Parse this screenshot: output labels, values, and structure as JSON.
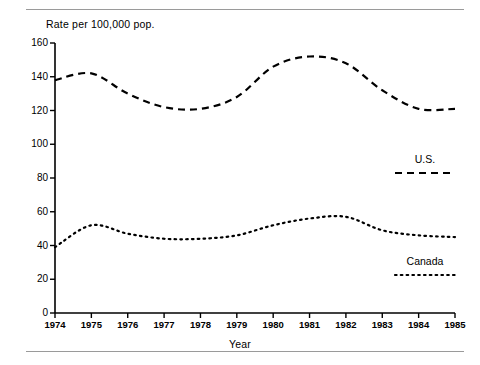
{
  "figure": {
    "top_rule": "horizontal-rule",
    "bottom_rule": "horizontal-rule"
  },
  "chart_data": {
    "type": "line",
    "title": "",
    "subtitle": "",
    "xlabel": "Year",
    "ylabel": "Rate per 100,000 pop.",
    "xlim": [
      1974,
      1985
    ],
    "ylim": [
      0,
      160
    ],
    "ytick_labels": [
      "0",
      "20",
      "40",
      "60",
      "80",
      "100",
      "120",
      "140",
      "160"
    ],
    "ytick_values": [
      0,
      20,
      40,
      60,
      80,
      100,
      120,
      140,
      160
    ],
    "xtick_labels": [
      "1974",
      "1975",
      "1976",
      "1977",
      "1978",
      "1979",
      "1980",
      "1981",
      "1982",
      "1983",
      "1984",
      "1985"
    ],
    "x": [
      1974,
      1975,
      1976,
      1977,
      1978,
      1979,
      1980,
      1981,
      1982,
      1983,
      1984,
      1985
    ],
    "grid": false,
    "legend_position": "right-inside",
    "series": [
      {
        "name": "U.S.",
        "linestyle": "dashed",
        "color": "#000000",
        "values": [
          138,
          142,
          130,
          122,
          121,
          128,
          146,
          152,
          148,
          132,
          121,
          121
        ]
      },
      {
        "name": "Canada",
        "linestyle": "dotted",
        "color": "#000000",
        "values": [
          39,
          52,
          47,
          44,
          44,
          46,
          52,
          56,
          57,
          49,
          46,
          45
        ]
      }
    ],
    "annotations": []
  },
  "legend": {
    "items": [
      {
        "label": "U.S.",
        "style": "dashed"
      },
      {
        "label": "Canada",
        "style": "dotted"
      }
    ]
  }
}
